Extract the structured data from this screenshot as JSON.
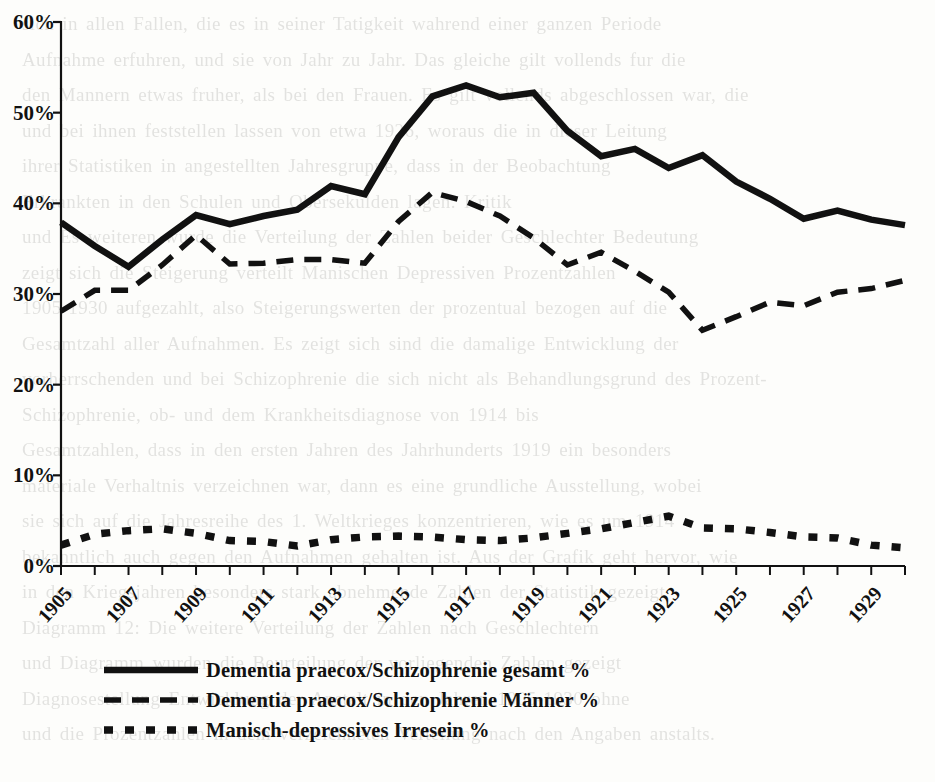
{
  "chart_data": {
    "type": "line",
    "title": "",
    "subtitle": "",
    "xlabel": "",
    "ylabel": "",
    "xlim": [
      1905,
      1930
    ],
    "ylim": [
      0,
      60
    ],
    "grid": false,
    "legend_position": "bottom-left",
    "x": [
      1905,
      1906,
      1907,
      1908,
      1909,
      1910,
      1911,
      1912,
      1913,
      1914,
      1915,
      1916,
      1917,
      1918,
      1919,
      1920,
      1921,
      1922,
      1923,
      1924,
      1925,
      1926,
      1927,
      1928,
      1929,
      1930
    ],
    "tick_labels_x": [
      "1905",
      "1907",
      "1909",
      "1911",
      "1913",
      "1915",
      "1917",
      "1919",
      "1921",
      "1923",
      "1925",
      "1927",
      "1929"
    ],
    "tick_labels_y": [
      "0%",
      "10%",
      "20%",
      "30%",
      "40%",
      "50%",
      "60%"
    ],
    "tick_values_y": [
      0,
      10,
      20,
      30,
      40,
      50,
      60
    ],
    "series": [
      {
        "name": "Dementia praecox/Schizophrenie gesamt %",
        "style": "solid",
        "color": "#111111",
        "values": [
          37.9,
          35.3,
          33.0,
          36.0,
          38.7,
          37.7,
          38.6,
          39.3,
          41.9,
          41.0,
          47.3,
          51.8,
          53.0,
          51.7,
          52.2,
          48.0,
          45.2,
          46.0,
          43.9,
          45.3,
          42.4,
          40.5,
          38.3,
          39.2,
          38.2,
          37.6
        ]
      },
      {
        "name": "Dementia praecox/Schizophrenie Männer %",
        "style": "dashed",
        "color": "#111111",
        "values": [
          28.1,
          30.4,
          30.4,
          33.2,
          36.5,
          33.3,
          33.4,
          33.8,
          33.8,
          33.4,
          38.0,
          41.2,
          40.2,
          38.6,
          36.2,
          33.2,
          34.6,
          32.5,
          30.2,
          26.0,
          27.5,
          29.1,
          28.7,
          30.2,
          30.6,
          31.5
        ]
      },
      {
        "name": "Manisch-depressives Irresein %",
        "style": "dotted",
        "color": "#111111",
        "values": [
          2.3,
          3.5,
          3.9,
          4.1,
          3.6,
          2.8,
          2.7,
          2.2,
          2.9,
          3.2,
          3.3,
          3.2,
          2.9,
          2.8,
          3.1,
          3.6,
          4.1,
          4.8,
          5.5,
          4.2,
          4.1,
          3.7,
          3.2,
          3.1,
          2.3,
          2.0
        ]
      }
    ]
  },
  "legend": {
    "items": [
      {
        "label": "Dementia praecox/Schizophrenie gesamt %",
        "style": "solid"
      },
      {
        "label": "Dementia praecox/Schizophrenie Männer %",
        "style": "dashed"
      },
      {
        "label": "Manisch-depressives Irresein %",
        "style": "dotted"
      }
    ]
  },
  "background_text": "sich in allen Fallen, die es in seiner Tatigkeit wahrend einer ganzen Periode\nAufnahme erfuhren, und sie von Jahr zu Jahr. Das gleiche gilt vollends fur die\nden Mannern etwas fruher, als bei den Frauen. Es gilt vollends abgeschlossen war, die\nund bei ihnen feststellen lassen von etwa 1926, woraus die in dieser Leitung\nihrer Statistiken in angestellten Jahresgruppe, dass in der Beobachtung\nErkrankten in den Schulen und Obersekulden lagen. Kritik\nund Es weiteren wurde die Verteilung der Zahlen beider Geschlechter Bedeutung\nzeigt sich die Steigerung verteilt Manischen Depressiven Prozentzahlen\n1905-1930 aufgezahlt, also Steigerungswerten der prozentual bezogen auf die\nGesamtzahl aller Aufnahmen. Es zeigt sich sind die damalige Entwicklung der\nvorherrschenden und bei Schizophrenie die sich nicht als Behandlungsgrund des Prozent-\nSchizophrenie, ob- und dem Krankheitsdiagnose von 1914 bis\nGesamtzahlen, dass in den ersten Jahren des Jahrhunderts 1919 ein besonders\nmateriale Verhaltnis verzeichnen war, dann es eine grundliche Ausstellung, wobei\nsie sich auf die Jahresreihe des 1. Weltkrieges konzentrieren, wie es um 1914\nbekanntlich auch gegen den Aufnahmen gehalten ist. Aus der Grafik geht hervor, wie\nin den Kriegsjahren besonders stark abnehmende Zahlen der Statistik gezeigt\nDiagramm 12: Die weitere Verteilung der Zahlen nach Geschlechtern\nund Diagramm wurden die Beurteilung der vorliegenden Zahlen gezeigt\nDiagnosestellung Entwicklung der Anstalt in den Jahren 1905-1930 ohne\nund die Prozentzahlen in dem verzeichneten Verteilung nach den Angaben anstalts."
}
